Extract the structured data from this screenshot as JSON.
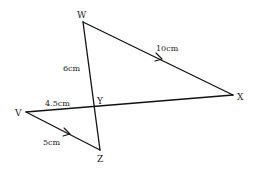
{
  "diagram": {
    "type": "geometry",
    "points": {
      "W": {
        "label": "W",
        "x": 83,
        "y": 22
      },
      "X": {
        "label": "X",
        "x": 233,
        "y": 95
      },
      "V": {
        "label": "V",
        "x": 26,
        "y": 112
      },
      "Z": {
        "label": "Z",
        "x": 100,
        "y": 150
      },
      "Y": {
        "label": "Y",
        "x": 95,
        "y": 107
      }
    },
    "segments": [
      {
        "from": "W",
        "to": "X",
        "length_label": "10cm",
        "parallel_mark": true
      },
      {
        "from": "W",
        "to": "Z",
        "partial_label": "6cm",
        "labeled_part": "WY"
      },
      {
        "from": "V",
        "to": "X",
        "partial_label": "4.5cm",
        "labeled_part": "VY"
      },
      {
        "from": "V",
        "to": "Z",
        "length_label": "5cm",
        "parallel_mark": true
      }
    ],
    "measurements": {
      "WX": "10cm",
      "WY": "6cm",
      "VY": "4.5cm",
      "VZ": "5cm"
    }
  }
}
